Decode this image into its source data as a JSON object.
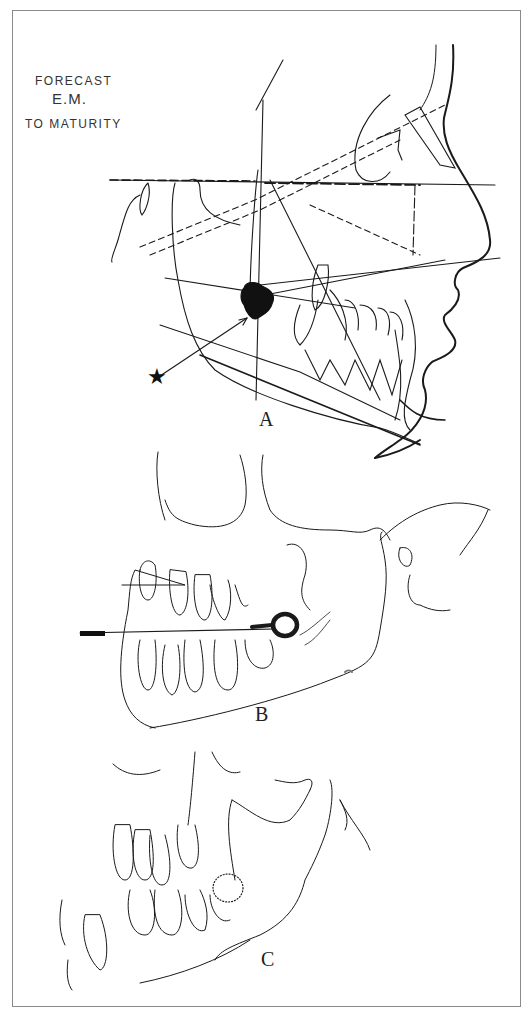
{
  "figure": {
    "caption_lines": [
      "FORECAST",
      "E.M.",
      "TO MATURITY"
    ],
    "panels": [
      {
        "id": "A",
        "label": "A",
        "description": "Lateral cephalometric tracing with forecast of E.M. to maturity; star marker with arrow pointing to dark blob"
      },
      {
        "id": "B",
        "label": "B",
        "description": "Mandible and maxilla drawing with horizontal line through dental arch and ring marker"
      },
      {
        "id": "C",
        "label": "C",
        "description": "Mandible drawing with developing teeth and stippled tooth bud"
      }
    ],
    "markers": {
      "star": "★"
    },
    "colors": {
      "ink": "#1a1a1a",
      "frame": "#8a8a8a",
      "background": "#ffffff"
    }
  }
}
